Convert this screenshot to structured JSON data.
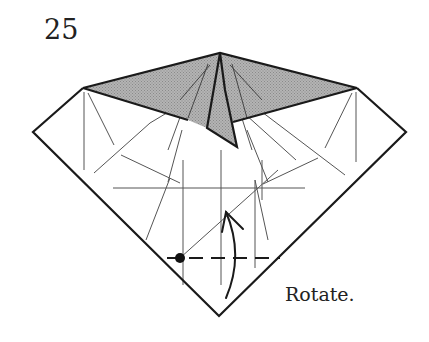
{
  "step": {
    "number": "25",
    "instruction": "Rotate."
  },
  "diagram": {
    "colors": {
      "outline": "#1a1a1a",
      "crease": "#555555",
      "shade": "#a9a9a9",
      "paper": "#ffffff"
    },
    "symbols": [
      "dot-reference-icon",
      "valley-fold-dashed-line",
      "rotate-arrow-icon"
    ]
  }
}
